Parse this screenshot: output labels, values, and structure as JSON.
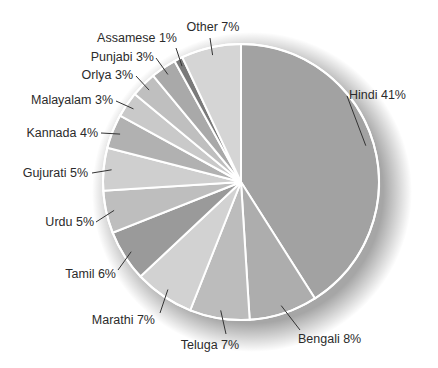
{
  "chart_data": {
    "type": "pie",
    "title": "",
    "categories": [
      "Hindi",
      "Bengali",
      "Teluga",
      "Marathi",
      "Tamil",
      "Urdu",
      "Gujurati",
      "Kannada",
      "Malayalam",
      "Orlya",
      "Punjabi",
      "Assamese",
      "Other"
    ],
    "values": [
      41,
      8,
      7,
      7,
      6,
      5,
      5,
      4,
      3,
      3,
      3,
      1,
      7
    ],
    "unit": "%",
    "labels": [
      "Hindi 41%",
      "Bengali 8%",
      "Teluga 7%",
      "Marathi 7%",
      "Tamil 6%",
      "Urdu 5%",
      "Gujurati 5%",
      "Kannada 4%",
      "Malayalam 3%",
      "Orlya 3%",
      "Punjabi 3%",
      "Assamese 1%",
      "Other 7%"
    ],
    "colors": [
      "#a2a2a2",
      "#adadad",
      "#bcbcbc",
      "#d2d2d2",
      "#9a9a9a",
      "#bebebe",
      "#cfcfcf",
      "#b1b1b1",
      "#c9c9c9",
      "#bfbfbf",
      "#a9a9a9",
      "#7a7a7a",
      "#d5d5d5"
    ],
    "start_angle_deg": 0,
    "direction": "clockwise",
    "legend": "none",
    "label_style": "outside with leader lines"
  }
}
